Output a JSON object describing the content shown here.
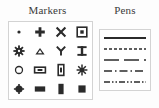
{
  "panels": {
    "markers": {
      "title": "Markers",
      "columns": 4,
      "rows": 4,
      "items": [
        {
          "name": "dot-marker",
          "glyph": "small filled dot"
        },
        {
          "name": "plus-cross-marker",
          "glyph": "filled plus / cross"
        },
        {
          "name": "x-cross-marker",
          "glyph": "x cross"
        },
        {
          "name": "square-in-square-marker",
          "glyph": "square with inner square"
        },
        {
          "name": "gear-marker",
          "glyph": "gear / cog"
        },
        {
          "name": "triangle-marker",
          "glyph": "filled triangle"
        },
        {
          "name": "y-fork-marker",
          "glyph": "y fork"
        },
        {
          "name": "i-beam-marker",
          "glyph": "i-beam / hourglass"
        },
        {
          "name": "open-circle-marker",
          "glyph": "open circle"
        },
        {
          "name": "wide-rect-outline-marker",
          "glyph": "wide rectangle with inner bar"
        },
        {
          "name": "tall-rect-outline-marker",
          "glyph": "tall rectangle with inner bar"
        },
        {
          "name": "starburst-marker",
          "glyph": "starburst / asterisk"
        },
        {
          "name": "filled-circle-marker",
          "glyph": "filled circle"
        },
        {
          "name": "filled-wide-rect-marker",
          "glyph": "filled wide rectangle"
        },
        {
          "name": "filled-tall-rect-marker",
          "glyph": "filled tall rectangle"
        },
        {
          "name": "filled-square-marker",
          "glyph": "filled square"
        }
      ]
    },
    "pens": {
      "title": "Pens",
      "items": [
        {
          "name": "solid-pen",
          "style": "solid",
          "dash": "none",
          "width": 1.6
        },
        {
          "name": "dashed-pen",
          "style": "dash",
          "dash": "3,2",
          "width": 1.3
        },
        {
          "name": "long-dash-pen",
          "style": "long-dash",
          "dash": "14,4",
          "width": 1.5
        },
        {
          "name": "dash-dot-pen",
          "style": "dash-dot",
          "dash": "7,3,1.5,3",
          "width": 1.4
        },
        {
          "name": "dash-dot-dot-pen",
          "style": "dash-dot-dot",
          "dash": "6,2,1.5,2,1.5,2",
          "width": 1.4
        }
      ]
    }
  },
  "colors": {
    "ink": "#2b2b2b",
    "title": "#3a3a3a",
    "panel_border": "#d3d3d3",
    "background": "#fdfdfd"
  }
}
